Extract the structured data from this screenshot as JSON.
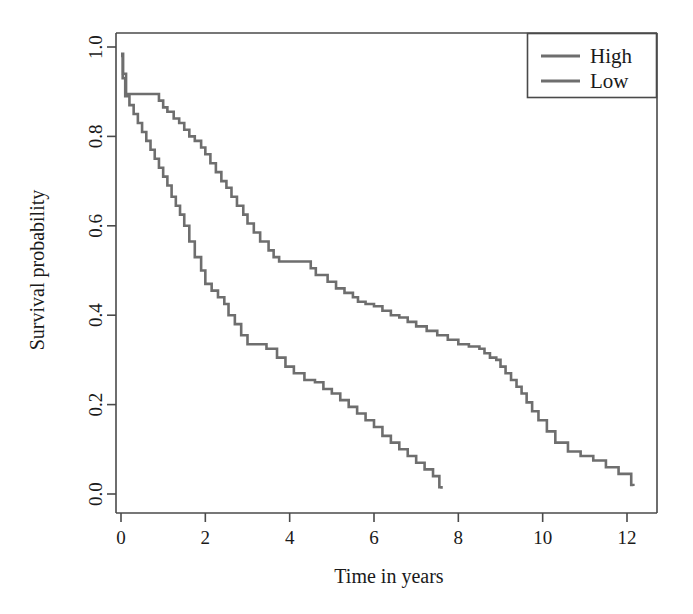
{
  "chart_data": {
    "type": "line",
    "title": "",
    "subtitle": "",
    "xlabel": "Time in years",
    "ylabel": "Survival probability",
    "xlim": [
      -0.25,
      12.6
    ],
    "ylim": [
      -0.02,
      1.02
    ],
    "xticks": [
      0,
      2,
      4,
      6,
      8,
      10,
      12
    ],
    "xtick_labels": [
      "0",
      "2",
      "4",
      "6",
      "8",
      "10",
      "12"
    ],
    "yticks": [
      0.0,
      0.2,
      0.4,
      0.6,
      0.8,
      1.0
    ],
    "ytick_labels": [
      "0.0",
      "0.2",
      "0.4",
      "0.6",
      "0.8",
      "1.0"
    ],
    "grid": false,
    "legend_position": "top-right",
    "legend_entries": [
      "High",
      "Low"
    ],
    "line_color": "#6e6e6e",
    "axis_color": "#4a4a4a",
    "background_color": "#ffffff",
    "step_style": "post",
    "series": [
      {
        "name": "High",
        "color": "#6e6e6e",
        "x": [
          0.0,
          0.05,
          0.12,
          0.75,
          0.9,
          1.0,
          1.1,
          1.25,
          1.38,
          1.5,
          1.62,
          1.75,
          1.9,
          2.0,
          2.12,
          2.25,
          2.38,
          2.5,
          2.62,
          2.75,
          2.9,
          3.0,
          3.15,
          3.3,
          3.5,
          3.62,
          3.75,
          4.35,
          4.5,
          4.62,
          4.75,
          4.9,
          5.1,
          5.3,
          5.5,
          5.62,
          5.8,
          6.0,
          6.2,
          6.4,
          6.6,
          6.8,
          7.0,
          7.25,
          7.5,
          7.75,
          8.0,
          8.25,
          8.5,
          8.62,
          8.75,
          8.9,
          9.0,
          9.12,
          9.25,
          9.38,
          9.5,
          9.62,
          9.75,
          9.9,
          10.1,
          10.3,
          10.6,
          10.9,
          11.2,
          11.5,
          11.8,
          12.1
        ],
        "y": [
          0.985,
          0.94,
          0.895,
          0.895,
          0.88,
          0.865,
          0.855,
          0.84,
          0.83,
          0.815,
          0.8,
          0.79,
          0.775,
          0.76,
          0.74,
          0.72,
          0.7,
          0.685,
          0.665,
          0.645,
          0.625,
          0.605,
          0.585,
          0.565,
          0.545,
          0.53,
          0.52,
          0.52,
          0.505,
          0.49,
          0.49,
          0.475,
          0.46,
          0.45,
          0.44,
          0.43,
          0.425,
          0.42,
          0.41,
          0.4,
          0.395,
          0.385,
          0.375,
          0.365,
          0.355,
          0.345,
          0.335,
          0.33,
          0.325,
          0.315,
          0.305,
          0.3,
          0.285,
          0.27,
          0.255,
          0.24,
          0.225,
          0.205,
          0.185,
          0.165,
          0.14,
          0.115,
          0.095,
          0.085,
          0.075,
          0.06,
          0.045,
          0.02
        ],
        "final_x": 12.15,
        "final_y": 0.018
      },
      {
        "name": "Low",
        "color": "#6e6e6e",
        "x": [
          0.0,
          0.04,
          0.1,
          0.2,
          0.3,
          0.4,
          0.5,
          0.6,
          0.7,
          0.8,
          0.9,
          1.0,
          1.1,
          1.2,
          1.3,
          1.4,
          1.5,
          1.62,
          1.75,
          1.9,
          2.0,
          2.15,
          2.3,
          2.45,
          2.55,
          2.7,
          2.85,
          3.0,
          3.2,
          3.45,
          3.7,
          3.9,
          4.1,
          4.35,
          4.6,
          4.8,
          5.0,
          5.2,
          5.4,
          5.6,
          5.8,
          6.0,
          6.2,
          6.4,
          6.6,
          6.8,
          7.0,
          7.2,
          7.4,
          7.55
        ],
        "y": [
          0.98,
          0.93,
          0.89,
          0.87,
          0.85,
          0.83,
          0.81,
          0.79,
          0.77,
          0.75,
          0.73,
          0.71,
          0.69,
          0.665,
          0.645,
          0.625,
          0.6,
          0.565,
          0.53,
          0.5,
          0.47,
          0.455,
          0.44,
          0.425,
          0.4,
          0.38,
          0.355,
          0.335,
          0.335,
          0.325,
          0.305,
          0.285,
          0.27,
          0.255,
          0.25,
          0.235,
          0.225,
          0.21,
          0.195,
          0.18,
          0.165,
          0.15,
          0.13,
          0.115,
          0.1,
          0.085,
          0.07,
          0.055,
          0.04,
          0.015
        ],
        "final_x": 7.6,
        "final_y": 0.012
      }
    ]
  },
  "axes": {
    "x_title": "Time in years",
    "y_title": "Survival probability"
  },
  "legend": {
    "items": [
      {
        "label": "High"
      },
      {
        "label": "Low"
      }
    ]
  }
}
